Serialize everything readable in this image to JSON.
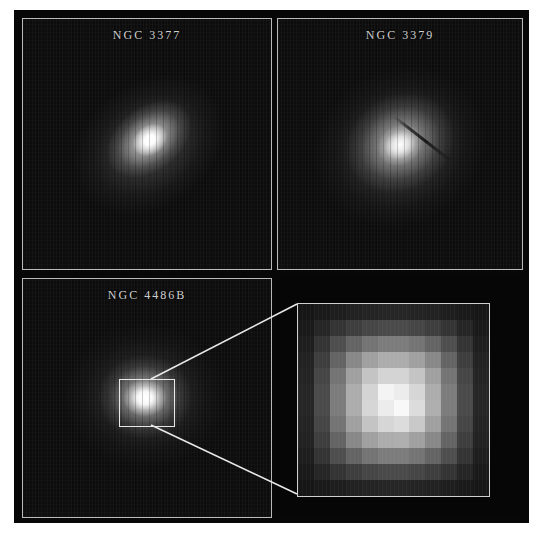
{
  "figure": {
    "background_color": "#ffffff",
    "plate_color": "#070707",
    "frame_color": "#b9b9b9",
    "label_color": "#cfcfcf"
  },
  "panels": [
    {
      "id": "ngc3377",
      "label": "NGC 3377",
      "position": "top-left",
      "description": "Elliptical galaxy with bright compact nucleus elongated along a NE-SW axis"
    },
    {
      "id": "ngc3379",
      "label": "NGC 3379",
      "position": "top-right",
      "description": "Diffuse elliptical galaxy halo with a narrow dark dust lane southeast of the nucleus"
    },
    {
      "id": "ngc4486b",
      "label": "NGC 4486B",
      "position": "bottom-left",
      "description": "Compact elliptical with bright core marked by a callout box that is magnified in the inset"
    },
    {
      "id": "inset",
      "label": "",
      "position": "bottom-right",
      "description": "Pixel-resolution magnification of the NGC 4486B nucleus showing a double nucleus"
    }
  ],
  "callout": {
    "source_panel": "ngc4486b",
    "target_panel": "inset",
    "line_color": "#e8e8e8"
  },
  "chart_data": {
    "type": "heatmap",
    "xlabel": "",
    "ylabel": "",
    "grid": false,
    "colormap": "grayscale",
    "vmin": 0,
    "vmax": 255,
    "rows": 12,
    "cols": 12,
    "values": [
      [
        22,
        26,
        30,
        34,
        36,
        38,
        38,
        36,
        34,
        30,
        26,
        22
      ],
      [
        26,
        38,
        52,
        62,
        70,
        74,
        74,
        70,
        62,
        52,
        38,
        26
      ],
      [
        30,
        52,
        78,
        100,
        116,
        124,
        124,
        116,
        100,
        78,
        52,
        30
      ],
      [
        34,
        62,
        100,
        136,
        160,
        172,
        172,
        160,
        136,
        100,
        62,
        34
      ],
      [
        36,
        70,
        116,
        160,
        196,
        212,
        212,
        196,
        160,
        116,
        70,
        36
      ],
      [
        38,
        74,
        124,
        172,
        212,
        244,
        236,
        214,
        172,
        124,
        74,
        38
      ],
      [
        38,
        74,
        124,
        172,
        214,
        236,
        248,
        220,
        174,
        124,
        74,
        38
      ],
      [
        36,
        70,
        116,
        160,
        196,
        214,
        220,
        200,
        160,
        116,
        70,
        36
      ],
      [
        34,
        62,
        100,
        136,
        160,
        172,
        174,
        160,
        136,
        100,
        62,
        34
      ],
      [
        30,
        52,
        78,
        100,
        116,
        124,
        124,
        116,
        100,
        78,
        52,
        30
      ],
      [
        26,
        38,
        52,
        62,
        70,
        74,
        74,
        70,
        62,
        52,
        38,
        26
      ],
      [
        22,
        26,
        30,
        34,
        36,
        38,
        38,
        36,
        34,
        30,
        26,
        22
      ]
    ]
  }
}
